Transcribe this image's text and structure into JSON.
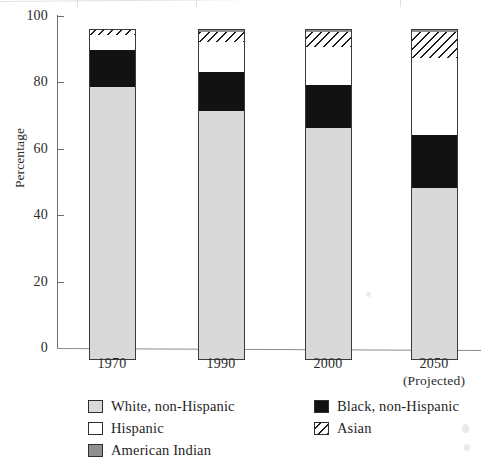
{
  "chart_data": {
    "type": "bar",
    "subtype": "stacked-bar-100",
    "title": "",
    "xlabel": "",
    "ylabel": "Percentage",
    "ylim": [
      0,
      100
    ],
    "yticks": [
      0,
      20,
      40,
      60,
      80,
      100
    ],
    "ytick_labels": [
      "0",
      "20",
      "40",
      "60",
      "80",
      "100"
    ],
    "grid": false,
    "legend_position": "bottom",
    "categories": [
      "1970",
      "1990",
      "2000",
      "2050"
    ],
    "category_sublabels": [
      "",
      "",
      "",
      "(Projected)"
    ],
    "stack_order_bottom_to_top": [
      "White, non-Hispanic",
      "Black, non-Hispanic",
      "Hispanic",
      "Asian",
      "American Indian"
    ],
    "series": [
      {
        "name": "White, non-Hispanic",
        "color": "#d9d9d9",
        "pattern": "solid",
        "values": [
          82.5,
          75.0,
          70.0,
          52.0
        ]
      },
      {
        "name": "Black, non-Hispanic",
        "color": "#121212",
        "pattern": "solid",
        "values": [
          11.0,
          12.0,
          13.0,
          16.0
        ]
      },
      {
        "name": "Hispanic",
        "color": "#ffffff",
        "pattern": "solid",
        "values": [
          4.5,
          9.0,
          11.5,
          23.0
        ]
      },
      {
        "name": "Asian",
        "color": "#ffffff",
        "pattern": "hatched",
        "values": [
          1.5,
          3.0,
          4.5,
          8.0
        ]
      },
      {
        "name": "American Indian",
        "color": "#8f8f8f",
        "pattern": "solid",
        "values": [
          0.5,
          1.0,
          1.0,
          1.0
        ]
      }
    ]
  },
  "axis": {
    "y_label": "Percentage",
    "y_ticks": [
      "100",
      "80",
      "60",
      "40",
      "20",
      "0"
    ]
  },
  "x_labels": [
    {
      "year": "1970",
      "sub": ""
    },
    {
      "year": "1990",
      "sub": ""
    },
    {
      "year": "2000",
      "sub": ""
    },
    {
      "year": "2050",
      "sub": "(Projected)"
    }
  ],
  "legend": {
    "items": [
      {
        "label": "White, non-Hispanic",
        "swatch": "light-gray"
      },
      {
        "label": "Black, non-Hispanic",
        "swatch": "black"
      },
      {
        "label": "Hispanic",
        "swatch": "white"
      },
      {
        "label": "Asian",
        "swatch": "hatched"
      },
      {
        "label": "American Indian",
        "swatch": "dark-gray"
      }
    ]
  },
  "colors": {
    "white_non_hispanic": "#d9d9d9",
    "black_non_hispanic": "#121212",
    "hispanic": "#ffffff",
    "asian_hatch": "#1c1c1c",
    "american_indian": "#8f8f8f",
    "axis": "#6e6e6e",
    "text": "#1f1f1f"
  }
}
